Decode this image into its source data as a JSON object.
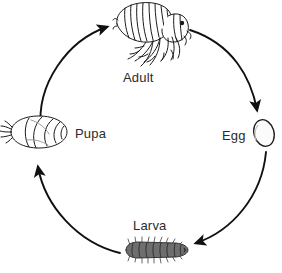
{
  "diagram": {
    "type": "cycle",
    "background_color": "#ffffff",
    "ink_color": "#1a1a1a",
    "label_color": "#2b2b2b",
    "stages": [
      {
        "id": "adult",
        "label": "Adult",
        "icon": "flea-adult-icon",
        "position": "top"
      },
      {
        "id": "egg",
        "label": "Egg",
        "icon": "flea-egg-icon",
        "position": "right"
      },
      {
        "id": "larva",
        "label": "Larva",
        "icon": "flea-larva-icon",
        "position": "bottom"
      },
      {
        "id": "pupa",
        "label": "Pupa",
        "icon": "flea-pupa-icon",
        "position": "left"
      }
    ],
    "arrows": [
      {
        "id": "adult-to-egg",
        "from": "Adult",
        "to": "Egg",
        "icon": "arrow-curved-icon"
      },
      {
        "id": "egg-to-larva",
        "from": "Egg",
        "to": "Larva",
        "icon": "arrow-curved-icon"
      },
      {
        "id": "larva-to-pupa",
        "from": "Larva",
        "to": "Pupa",
        "icon": "arrow-curved-icon"
      },
      {
        "id": "pupa-to-adult",
        "from": "Pupa",
        "to": "Adult",
        "icon": "arrow-curved-icon"
      }
    ],
    "footer_clipped_text": ""
  }
}
